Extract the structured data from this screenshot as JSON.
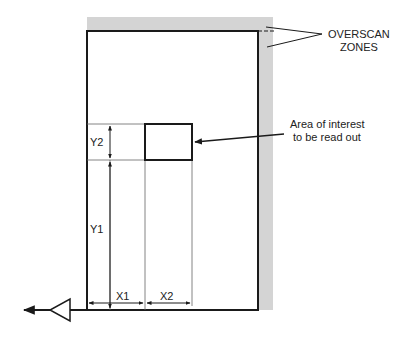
{
  "diagram": {
    "type": "technical-schematic",
    "labels": {
      "overscan_line1": "OVERSCAN",
      "overscan_line2": "ZONES",
      "aoi_line1": "Area of interest",
      "aoi_line2": "to be read out",
      "y1": "Y1",
      "y2": "Y2",
      "x1": "X1",
      "x2": "X2"
    },
    "colors": {
      "stroke": "#1a1a1a",
      "thin": "#555555",
      "overscan": "#d4d4d4",
      "background": "#ffffff"
    }
  }
}
